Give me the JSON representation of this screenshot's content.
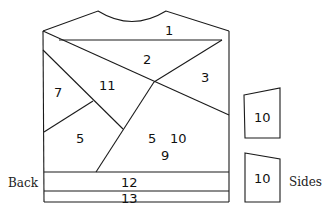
{
  "diagram": {
    "labels": {
      "back": "Back",
      "sides": "Sides"
    },
    "back_regions": [
      {
        "id": "r1",
        "label": "1",
        "x": 168,
        "y": 33
      },
      {
        "id": "r2",
        "label": "2",
        "x": 147,
        "y": 63
      },
      {
        "id": "r3",
        "label": "3",
        "x": 205,
        "y": 81
      },
      {
        "id": "r11",
        "label": "11",
        "x": 105,
        "y": 90
      },
      {
        "id": "r7",
        "label": "7",
        "x": 58,
        "y": 97
      },
      {
        "id": "r5a",
        "label": "5",
        "x": 80,
        "y": 143
      },
      {
        "id": "r5b",
        "label": "5",
        "x": 152,
        "y": 143
      },
      {
        "id": "r10",
        "label": "10",
        "x": 177,
        "y": 143
      },
      {
        "id": "r9",
        "label": "9",
        "x": 165,
        "y": 160
      },
      {
        "id": "r12",
        "label": "12",
        "x": 128,
        "y": 187
      },
      {
        "id": "r13",
        "label": "13",
        "x": 128,
        "y": 203
      }
    ],
    "side_panels": [
      {
        "id": "side-top",
        "label": "10"
      },
      {
        "id": "side-bottom",
        "label": "10"
      }
    ]
  }
}
